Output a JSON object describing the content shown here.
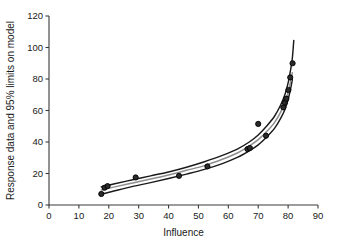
{
  "chart_data": {
    "type": "scatter",
    "title": "",
    "subtitle": "",
    "xlabel": "Influence",
    "ylabel": "Response data and 95% limits on model",
    "xlim": [
      0,
      90
    ],
    "ylim": [
      0,
      120
    ],
    "xticks": [
      0,
      10,
      20,
      30,
      40,
      50,
      60,
      70,
      80,
      90
    ],
    "yticks": [
      0,
      20,
      40,
      60,
      80,
      100,
      120
    ],
    "xtick_labels": [
      "0",
      "10",
      "20",
      "30",
      "40",
      "50",
      "60",
      "70",
      "80",
      "90"
    ],
    "ytick_labels": [
      "0",
      "20",
      "40",
      "60",
      "80",
      "100",
      "120"
    ],
    "grid": false,
    "legend": false,
    "legend_position": "none",
    "annotations": [],
    "series": [
      {
        "name": "Response data",
        "type": "scatter",
        "marker": "circle",
        "color": "#2a2a2a",
        "points": [
          {
            "x": 17.5,
            "y": 7
          },
          {
            "x": 18.6,
            "y": 11
          },
          {
            "x": 19.6,
            "y": 12
          },
          {
            "x": 29.0,
            "y": 17.5
          },
          {
            "x": 43.5,
            "y": 18.5
          },
          {
            "x": 53.0,
            "y": 24.5
          },
          {
            "x": 66.4,
            "y": 35.5
          },
          {
            "x": 67.2,
            "y": 36.2
          },
          {
            "x": 70.0,
            "y": 51.5
          },
          {
            "x": 72.6,
            "y": 44.0
          },
          {
            "x": 78.4,
            "y": 62.0
          },
          {
            "x": 78.9,
            "y": 65.0
          },
          {
            "x": 79.4,
            "y": 67.5
          },
          {
            "x": 80.1,
            "y": 73.0
          },
          {
            "x": 80.7,
            "y": 81.0
          },
          {
            "x": 81.5,
            "y": 90.0
          }
        ]
      },
      {
        "name": "Model fit",
        "type": "line",
        "color": "#8e8e8e",
        "x": [
          17.5,
          22,
          28,
          34,
          40,
          46,
          52,
          58,
          63,
          67,
          70,
          73,
          75.5,
          77.5,
          79,
          80,
          80.8,
          81.4
        ],
        "y": [
          9.5,
          11.5,
          14.0,
          16.5,
          19.0,
          22.0,
          25.0,
          29.0,
          33.0,
          37.5,
          41.5,
          47.0,
          52.5,
          59.0,
          65.5,
          71.5,
          78.0,
          84.0
        ]
      },
      {
        "name": "95% upper limit",
        "type": "line",
        "color": "#1a1a1a",
        "x": [
          17.5,
          22,
          28,
          34,
          40,
          46,
          52,
          58,
          63,
          67,
          70,
          73,
          75.5,
          77.5,
          79,
          80,
          80.8,
          81.4,
          81.9
        ],
        "y": [
          11.5,
          13.5,
          16.0,
          18.5,
          21.0,
          24.0,
          27.5,
          31.5,
          35.5,
          40.0,
          44.5,
          50.5,
          56.5,
          63.5,
          70.5,
          77.5,
          85.5,
          93.0,
          104.5
        ]
      },
      {
        "name": "95% lower limit",
        "type": "line",
        "color": "#1a1a1a",
        "x": [
          17.5,
          22,
          28,
          34,
          40,
          46,
          52,
          58,
          63,
          67,
          70,
          73,
          75.5,
          77.5,
          79,
          80,
          80.8,
          81.4
        ],
        "y": [
          6.8,
          9.0,
          11.8,
          14.2,
          16.8,
          19.6,
          22.6,
          26.3,
          30.2,
          34.4,
          38.2,
          43.5,
          48.8,
          55.0,
          61.0,
          67.0,
          73.5,
          79.5
        ]
      }
    ]
  }
}
